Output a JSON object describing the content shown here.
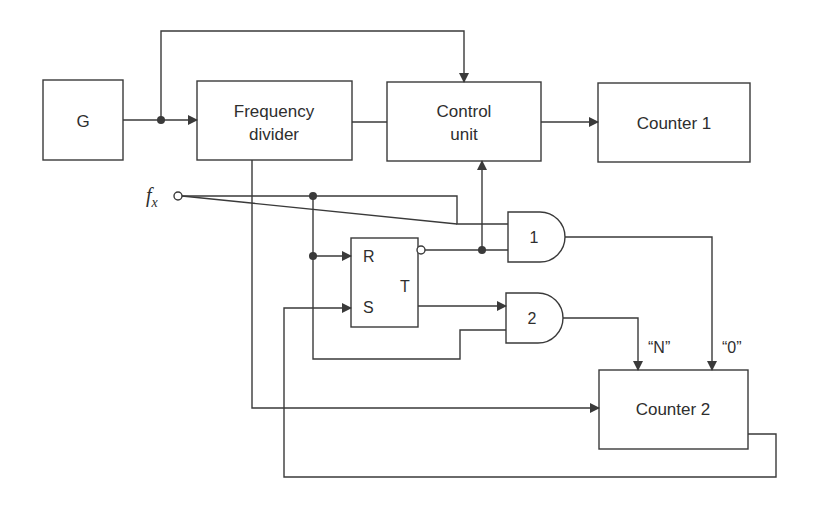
{
  "diagram": {
    "type": "block-diagram",
    "blocks": {
      "generator": {
        "label": "G"
      },
      "frequency_divider": {
        "line1": "Frequency",
        "line2": "divider"
      },
      "control_unit": {
        "line1": "Control",
        "line2": "unit"
      },
      "counter1": {
        "label": "Counter 1"
      },
      "counter2": {
        "label": "Counter 2"
      },
      "rs_trigger": {
        "r": "R",
        "s": "S",
        "t": "T"
      },
      "and_gate1": {
        "label": "1"
      },
      "and_gate2": {
        "label": "2"
      }
    },
    "input": {
      "symbol": "f",
      "subscript": "x"
    },
    "signals": {
      "n_label": "“N”",
      "zero_label": "“0”"
    },
    "connections": [
      {
        "from": "G",
        "to": "Frequency divider"
      },
      {
        "from": "G",
        "to": "Control unit"
      },
      {
        "from": "Frequency divider",
        "to": "Control unit"
      },
      {
        "from": "Control unit",
        "to": "Counter 1"
      },
      {
        "from": "Frequency divider",
        "to": "Counter 2"
      },
      {
        "from": "f_x",
        "to": "R"
      },
      {
        "from": "f_x",
        "to": "AND 1"
      },
      {
        "from": "f_x",
        "to": "AND 2"
      },
      {
        "from": "RS inverted output",
        "to": "AND 1"
      },
      {
        "from": "RS inverted output",
        "to": "Control unit"
      },
      {
        "from": "T",
        "to": "AND 2"
      },
      {
        "from": "AND 1",
        "to": "Counter 2",
        "label": "“0”"
      },
      {
        "from": "AND 2",
        "to": "Counter 2",
        "label": "“N”"
      },
      {
        "from": "Counter 2",
        "to": "S"
      }
    ]
  }
}
